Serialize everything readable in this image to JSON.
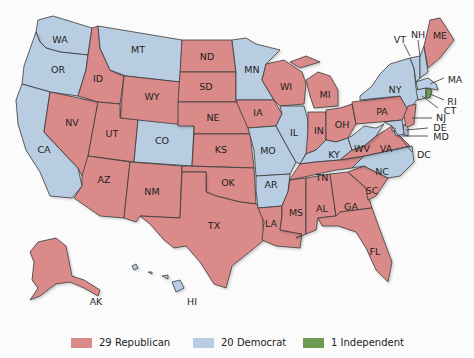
{
  "colors": {
    "republican": "#db8a8a",
    "democrat": "#b8cde2",
    "independent": "#6f9a52"
  },
  "legend": [
    {
      "label": "29 Republican",
      "party": "republican"
    },
    {
      "label": "20 Democrat",
      "party": "democrat"
    },
    {
      "label": "1 Independent",
      "party": "independent"
    }
  ],
  "states": {
    "WA": "democrat",
    "OR": "democrat",
    "CA": "democrat",
    "MT": "democrat",
    "ID": "republican",
    "NV": "republican",
    "WY": "republican",
    "UT": "republican",
    "AZ": "republican",
    "CO": "democrat",
    "NM": "republican",
    "ND": "republican",
    "SD": "republican",
    "NE": "republican",
    "KS": "republican",
    "OK": "republican",
    "TX": "republican",
    "MN": "democrat",
    "IA": "republican",
    "MO": "democrat",
    "AR": "democrat",
    "LA": "republican",
    "WI": "republican",
    "IL": "democrat",
    "MI": "republican",
    "IN": "republican",
    "OH": "republican",
    "KY": "democrat",
    "TN": "republican",
    "MS": "republican",
    "AL": "republican",
    "GA": "republican",
    "FL": "republican",
    "SC": "republican",
    "NC": "democrat",
    "VA": "republican",
    "WV": "democrat",
    "PA": "republican",
    "NY": "democrat",
    "VT": "democrat",
    "NH": "democrat",
    "ME": "republican",
    "MA": "democrat",
    "RI": "independent",
    "CT": "democrat",
    "NJ": "republican",
    "DE": "democrat",
    "MD": "democrat",
    "DC": "democrat",
    "AK": "republican",
    "HI": "democrat"
  },
  "labels": {
    "WA": "WA",
    "OR": "OR",
    "CA": "CA",
    "MT": "MT",
    "ID": "ID",
    "NV": "NV",
    "WY": "WY",
    "UT": "UT",
    "AZ": "AZ",
    "CO": "CO",
    "NM": "NM",
    "ND": "ND",
    "SD": "SD",
    "NE": "NE",
    "KS": "KS",
    "OK": "OK",
    "TX": "TX",
    "MN": "MN",
    "IA": "IA",
    "MO": "MO",
    "AR": "AR",
    "LA": "LA",
    "WI": "WI",
    "IL": "IL",
    "MI": "MI",
    "IN": "IN",
    "OH": "OH",
    "KY": "KY",
    "TN": "TN",
    "MS": "MS",
    "AL": "AL",
    "GA": "GA",
    "FL": "FL",
    "SC": "SC",
    "NC": "NC",
    "VA": "VA",
    "WV": "WV",
    "PA": "PA",
    "NY": "NY",
    "VT": "VT",
    "NH": "NH",
    "ME": "ME",
    "MA": "MA",
    "RI": "RI",
    "CT": "CT",
    "NJ": "NJ",
    "DE": "DE",
    "MD": "MD",
    "DC": "DC",
    "AK": "AK",
    "HI": "HI"
  }
}
